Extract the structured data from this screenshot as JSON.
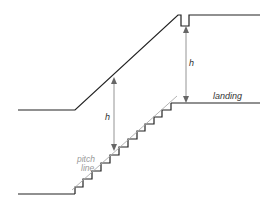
{
  "diagram": {
    "type": "stair-headroom-section",
    "labels": {
      "h_left": "h",
      "h_right": "h",
      "landing": "landing",
      "pitch_line_1": "pitch",
      "pitch_line_2": "line"
    },
    "colors": {
      "structure": "#222222",
      "dimension": "#888888",
      "pitch_line": "#aaaaaa",
      "label": "#333333",
      "pitch_label": "#999999"
    }
  }
}
